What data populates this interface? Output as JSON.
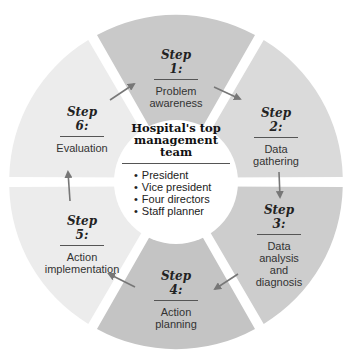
{
  "diagram": {
    "type": "cycle",
    "center": {
      "title_lines": [
        "Hospital's top",
        "management",
        "team"
      ],
      "members": [
        "President",
        "Vice president",
        "Four directors",
        "Staff planner"
      ]
    },
    "steps": [
      {
        "number": "Step 1:",
        "lines": [
          "Problem",
          "awareness"
        ],
        "fill": "#c9c9c9"
      },
      {
        "number": "Step 2:",
        "lines": [
          "Data",
          "gathering"
        ],
        "fill": "#dadada"
      },
      {
        "number": "Step 3:",
        "lines": [
          "Data",
          "analysis",
          "and",
          "diagnosis"
        ],
        "fill": "#cdcdcd"
      },
      {
        "number": "Step 4:",
        "lines": [
          "Action",
          "planning"
        ],
        "fill": "#c4c4c4"
      },
      {
        "number": "Step 5:",
        "lines": [
          "Action",
          "implementation"
        ],
        "fill": "#ececec"
      },
      {
        "number": "Step 6:",
        "lines": [
          "Evaluation"
        ],
        "fill": "#ececec"
      }
    ],
    "flow": [
      "Step 1",
      "Step 2",
      "Step 3",
      "Step 4",
      "Step 5",
      "Step 6",
      "Step 1"
    ],
    "colors": {
      "arrow": "#777777",
      "center": "#ffffff",
      "divider": "#555555"
    }
  }
}
